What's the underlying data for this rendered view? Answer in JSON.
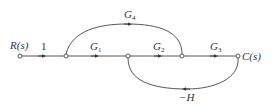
{
  "diagram": {
    "type": "signal-flow-graph",
    "input_label": "R(s)",
    "output_label": "C(s)",
    "nodes": [
      {
        "id": "n1",
        "x": 20,
        "y": 56
      },
      {
        "id": "n2",
        "x": 66,
        "y": 56
      },
      {
        "id": "n3",
        "x": 128,
        "y": 56
      },
      {
        "id": "n4",
        "x": 182,
        "y": 56
      },
      {
        "id": "n5",
        "x": 238,
        "y": 56
      }
    ],
    "branches": [
      {
        "from": "n1",
        "to": "n2",
        "gain": "1",
        "gain_main": "1",
        "gain_sub": ""
      },
      {
        "from": "n2",
        "to": "n3",
        "gain": "G1",
        "gain_main": "G",
        "gain_sub": "1"
      },
      {
        "from": "n3",
        "to": "n4",
        "gain": "G2",
        "gain_main": "G",
        "gain_sub": "2"
      },
      {
        "from": "n4",
        "to": "n5",
        "gain": "G3",
        "gain_main": "G",
        "gain_sub": "3"
      },
      {
        "from": "n2",
        "to": "n4",
        "gain": "G4",
        "gain_main": "G",
        "gain_sub": "4"
      },
      {
        "from": "n5",
        "to": "n3",
        "gain": "-H",
        "gain_main": "−H",
        "gain_sub": ""
      }
    ],
    "line_color": "#444444"
  }
}
